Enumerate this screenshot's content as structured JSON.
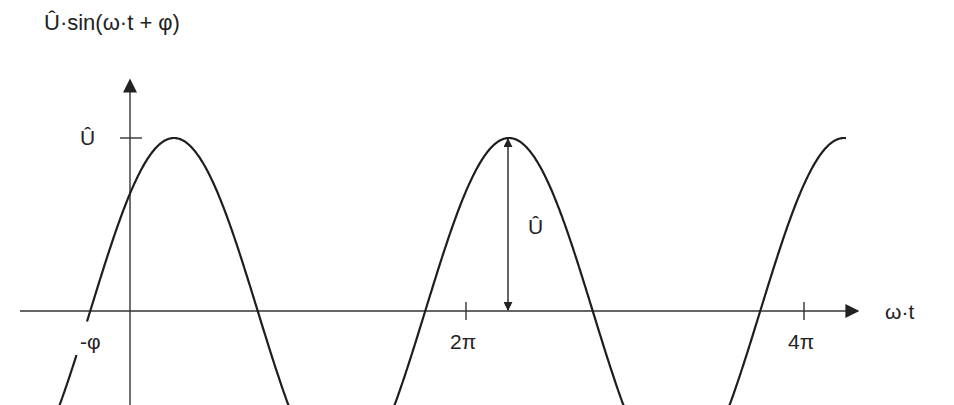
{
  "title": "Û·sin(ω·t + φ)",
  "colors": {
    "line": "#1e1e1e",
    "axis": "#333333",
    "background": "#ffffff"
  },
  "axes": {
    "x_label": "ω·t",
    "y_tick_label": "Û",
    "x_ticks": [
      {
        "label": "-φ",
        "value": -0.746
      },
      {
        "label": "2π",
        "value": 6.2832
      },
      {
        "label": "4π",
        "value": 12.5664
      }
    ]
  },
  "annotation": {
    "amplitude_arrow_label": "Û"
  },
  "chart_data": {
    "type": "line",
    "title": "Û·sin(ω·t + φ)",
    "xlabel": "ω·t",
    "ylabel": "Û·sin(ω·t + φ)",
    "function": "U_hat * sin(omega_t + phi)",
    "parameters": {
      "U_hat": 1,
      "phi_rad": 0.746
    },
    "x_tick_labels": [
      "-φ",
      "2π",
      "4π"
    ],
    "x_tick_values": [
      -0.746,
      6.2832,
      12.5664
    ],
    "y_tick_labels": [
      "Û"
    ],
    "y_tick_values": [
      1
    ],
    "xlim": [
      -2.06,
      13.3
    ],
    "ylim": [
      -0.55,
      1.3
    ],
    "series": [
      {
        "name": "Û·sin(ω·t + φ)",
        "x": [
          -0.746,
          0,
          0.825,
          2.396,
          3.967,
          5.538,
          7.108,
          8.679,
          10.25,
          11.821,
          13.392
        ],
        "values": [
          0,
          0.679,
          1,
          0,
          -1,
          0,
          1,
          0,
          -1,
          0,
          1
        ]
      }
    ],
    "annotations": [
      {
        "type": "double-arrow",
        "at_x": 7.108,
        "from_y": 0,
        "to_y": 1,
        "label": "Û"
      }
    ],
    "grid": false,
    "legend": "none"
  }
}
